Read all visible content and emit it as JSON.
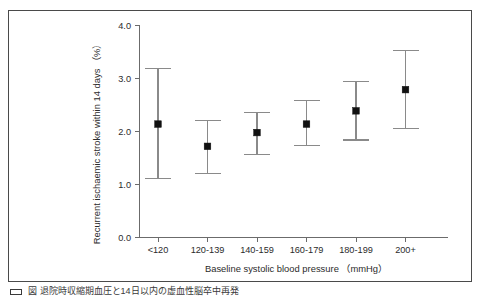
{
  "figure": {
    "caption": "図  退院時収縮期血圧と14日以内の虚血性脳卒中再発",
    "caption_marker_icon": "legend-swatch-icon"
  },
  "chart_data": {
    "type": "scatter",
    "title": "",
    "xlabel": "Baseline systolic blood pressure （mmHg）",
    "ylabel": "Recurrent ischaemic stroke within 14 days （%）",
    "categories": [
      "<120",
      "120-139",
      "140-159",
      "160-179",
      "180-199",
      "200+"
    ],
    "values": [
      2.14,
      1.72,
      1.98,
      2.14,
      2.39,
      2.79
    ],
    "error_low": [
      1.12,
      1.2,
      1.57,
      1.73,
      1.84,
      2.05
    ],
    "error_high": [
      3.19,
      2.21,
      2.36,
      2.58,
      2.94,
      3.52
    ],
    "error_type": "95% confidence interval",
    "ylim": [
      0.0,
      4.0
    ],
    "yticks": [
      "0.0",
      "1.0",
      "2.0",
      "3.0",
      "4.0"
    ],
    "ytick_values": [
      0.0,
      1.0,
      2.0,
      3.0,
      4.0
    ],
    "grid": false,
    "legend": "none",
    "marker_style": "filled-square",
    "series": [
      {
        "name": "Recurrent ischaemic stroke within 14 days (%)",
        "values": [
          2.14,
          1.72,
          1.98,
          2.14,
          2.39,
          2.79
        ]
      }
    ]
  },
  "colors": {
    "frame": "#4a4a4a",
    "axis": "#6b6b6b",
    "error_bar": "#8a8a8a",
    "marker": "#111111",
    "text": "#2b2b2b",
    "background": "#ffffff"
  }
}
